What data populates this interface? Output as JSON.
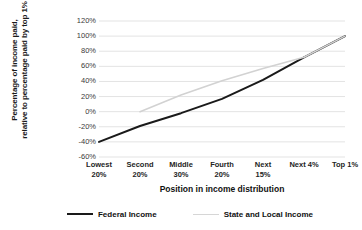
{
  "chart_data": {
    "type": "line",
    "title": "",
    "xlabel": "Position in income distribution",
    "ylabel": "Percentage of income paid, relative to percentage paid by top 1%",
    "ylabel_line1": "Percentage of income paid,",
    "ylabel_line2": "relative to percentage paid by top 1%",
    "categories": [
      "Lowest 20%",
      "Second 20%",
      "Middle 30%",
      "Fourth 20%",
      "Next 15%",
      "Next 4%",
      "Top 1%"
    ],
    "category_lines": [
      [
        "Lowest",
        "20%"
      ],
      [
        "Second",
        "20%"
      ],
      [
        "Middle",
        "30%"
      ],
      [
        "Fourth",
        "20%"
      ],
      [
        "Next",
        "15%"
      ],
      [
        "Next 4%",
        ""
      ],
      [
        "Top 1%",
        ""
      ]
    ],
    "ylim": [
      -60,
      120
    ],
    "ytick_values": [
      120,
      100,
      80,
      60,
      40,
      20,
      0,
      -20,
      -40,
      -60
    ],
    "ytick_labels": [
      "120%",
      "100%",
      "80%",
      "60%",
      "40%",
      "20%",
      "0%",
      "-20%",
      "-40%",
      "-60%"
    ],
    "grid": true,
    "legend_position": "bottom",
    "series": [
      {
        "name": "Federal Income",
        "color": "#1a1a1a",
        "width": 2.0,
        "values": [
          -40,
          -19,
          -2,
          17,
          42,
          72,
          100
        ]
      },
      {
        "name": "State and Local Income",
        "color": "#d2d2d2",
        "width": 1.6,
        "values": [
          null,
          0,
          22,
          41,
          57,
          72,
          100
        ]
      }
    ]
  },
  "legend": {
    "items": [
      {
        "label": "Federal Income",
        "color": "#1a1a1a",
        "width": "2px"
      },
      {
        "label": "State and Local Income",
        "color": "#d6d6d6",
        "width": "1.6px"
      }
    ]
  },
  "colors": {
    "grid": "#e3e3e3",
    "federal": "#1a1a1a",
    "state_local": "#d2d2d2",
    "background": "#ffffff",
    "text": "#1a1a1a"
  }
}
